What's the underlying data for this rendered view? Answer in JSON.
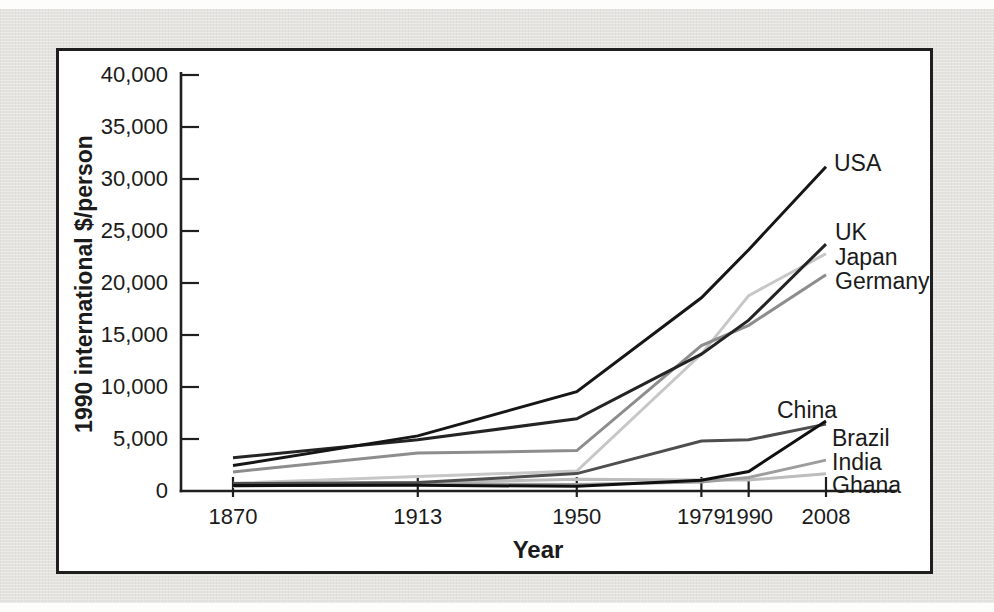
{
  "figure": {
    "page_background_color": "#e4e3df",
    "plot_background_color": "#ffffff",
    "frame_border_color": "#1f1f1f",
    "axis_color": "#1f1f1f",
    "text_color": "#1b1b1b"
  },
  "chart_data": {
    "type": "line",
    "title": "",
    "xlabel": "Year",
    "ylabel": "1990 international $/person",
    "x": [
      1870,
      1913,
      1950,
      1979,
      1990,
      2008
    ],
    "x_tick_labels": [
      "1870",
      "1913",
      "1950",
      "1979",
      "1990",
      "2008"
    ],
    "y_ticks": [
      0,
      5000,
      10000,
      15000,
      20000,
      25000,
      30000,
      35000,
      40000
    ],
    "y_tick_labels": [
      "0",
      "5,000",
      "10,000",
      "15,000",
      "20,000",
      "25,000",
      "30,000",
      "35,000",
      "40,000"
    ],
    "ylim": [
      0,
      40000
    ],
    "xlim": [
      1858,
      2025
    ],
    "grid": false,
    "legend_position": "line-end-labels",
    "series": [
      {
        "name": "USA",
        "color": "#161616",
        "values": [
          2445,
          5301,
          9561,
          18577,
          23201,
          31178
        ],
        "label_anchor": {
          "x": 834,
          "y": 163
        }
      },
      {
        "name": "UK",
        "color": "#242424",
        "values": [
          3190,
          4921,
          6939,
          13167,
          16430,
          23742
        ],
        "label_anchor": {
          "x": 835,
          "y": 232
        }
      },
      {
        "name": "Japan",
        "color": "#c7c7c7",
        "values": [
          737,
          1387,
          1921,
          13163,
          18789,
          22816
        ],
        "label_anchor": {
          "x": 835,
          "y": 257
        }
      },
      {
        "name": "Germany",
        "color": "#8d8d8d",
        "values": [
          1839,
          3648,
          3881,
          13993,
          15929,
          20801
        ],
        "label_anchor": {
          "x": 835,
          "y": 281
        }
      },
      {
        "name": "China",
        "color": "#101010",
        "values": [
          530,
          552,
          448,
          1039,
          1871,
          6725
        ],
        "label_anchor": {
          "x": 777,
          "y": 410
        }
      },
      {
        "name": "Brazil",
        "color": "#4e4e4e",
        "values": [
          713,
          811,
          1672,
          4809,
          4920,
          6429
        ],
        "label_anchor": {
          "x": 832,
          "y": 438
        }
      },
      {
        "name": "India",
        "color": "#9d9d9d",
        "values": [
          533,
          673,
          619,
          857,
          1309,
          2975
        ],
        "label_anchor": {
          "x": 832,
          "y": 462
        }
      },
      {
        "name": "Ghana",
        "color": "#bcbcbc",
        "values": [
          439,
          781,
          1122,
          1053,
          1062,
          1650
        ],
        "label_anchor": {
          "x": 832,
          "y": 485
        }
      }
    ],
    "draw_order": [
      "Japan",
      "Ghana",
      "India",
      "Germany",
      "Brazil",
      "UK",
      "USA",
      "China"
    ]
  }
}
